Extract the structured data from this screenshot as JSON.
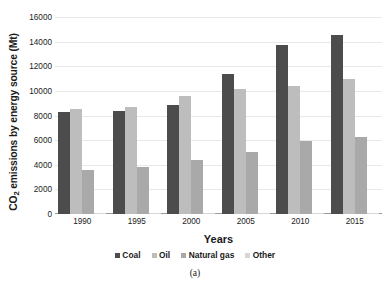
{
  "chart_data": {
    "type": "bar",
    "title": "",
    "subtitle": "",
    "xlabel": "Years",
    "ylabel": "CO2 emissions by energy source (Mt)",
    "ylabel_parts": {
      "pre": "CO",
      "sub": "2",
      "post": " emissions by energy source (Mt)"
    },
    "categories": [
      "1990",
      "1995",
      "2000",
      "2005",
      "2010",
      "2015"
    ],
    "series": [
      {
        "name": "Coal",
        "color": "#4c4c4c",
        "values": [
          8250,
          8400,
          8850,
          11400,
          13700,
          14500
        ]
      },
      {
        "name": "Oil",
        "color": "#bdbdbd",
        "values": [
          8500,
          8700,
          9550,
          10150,
          10400,
          11000
        ]
      },
      {
        "name": "Natural gas",
        "color": "#a9a9a9",
        "values": [
          3600,
          3850,
          4400,
          5050,
          5900,
          6250
        ]
      },
      {
        "name": "Other",
        "color": "#d6d6d6",
        "values": [
          60,
          65,
          70,
          75,
          80,
          85
        ]
      }
    ],
    "ylim": [
      0,
      16000
    ],
    "yticks": [
      0,
      2000,
      4000,
      6000,
      8000,
      10000,
      12000,
      14000,
      16000
    ],
    "ytick_labels": [
      "0",
      "2000",
      "4000",
      "6000",
      "8000",
      "10000",
      "12000",
      "14000",
      "16000"
    ],
    "grid": true,
    "grid_axis": "y",
    "legend": [
      "Coal",
      "Oil",
      "Natural gas",
      "Other"
    ],
    "legend_position": "bottom"
  },
  "caption": "(a)"
}
